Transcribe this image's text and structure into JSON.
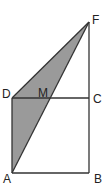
{
  "figure": {
    "type": "geometry-diagram",
    "points": {
      "A": {
        "label": "A",
        "x": 12,
        "y": 173
      },
      "B": {
        "label": "B",
        "x": 89,
        "y": 173
      },
      "C": {
        "label": "C",
        "x": 89,
        "y": 98
      },
      "D": {
        "label": "D",
        "x": 12,
        "y": 98
      },
      "M": {
        "label": "M",
        "x": 50,
        "y": 98
      },
      "F": {
        "label": "F",
        "x": 89,
        "y": 22
      }
    },
    "segments": [
      "AB",
      "BC",
      "CD",
      "DA",
      "CF",
      "DF",
      "AF"
    ],
    "shaded_regions": [
      "DMF",
      "DAM"
    ],
    "colors": {
      "line": "#333333",
      "shade": "#9a9a9a",
      "background": "#ffffff"
    }
  }
}
